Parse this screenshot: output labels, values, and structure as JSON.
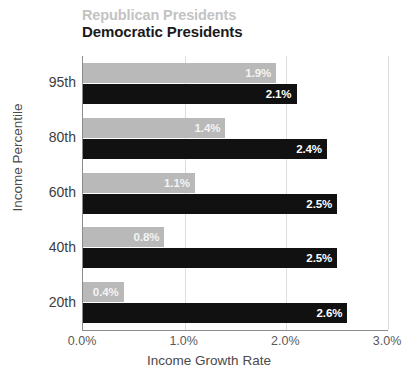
{
  "legend": {
    "republican": "Republican Presidents",
    "democratic": "Democratic Presidents",
    "republican_color": "#b9b9b9",
    "democratic_color": "#111111"
  },
  "axes": {
    "ylabel": "Income Percentile",
    "xlabel": "Income Growth Rate",
    "xticks": [
      "0.0%",
      "1.0%",
      "2.0%",
      "3.0%"
    ],
    "yticks": [
      "95th",
      "80th",
      "60th",
      "40th",
      "20th"
    ]
  },
  "chart_data": {
    "type": "bar",
    "orientation": "horizontal",
    "title": "",
    "subtitle": "",
    "xlabel": "Income Growth Rate",
    "ylabel": "Income Percentile",
    "xlim": [
      0,
      3
    ],
    "ylim": null,
    "grid": true,
    "legend_position": "top-left",
    "categories": [
      "95th",
      "80th",
      "60th",
      "40th",
      "20th"
    ],
    "series": [
      {
        "name": "Republican Presidents",
        "color": "#b9b9b9",
        "values": [
          1.9,
          1.4,
          1.1,
          0.8,
          0.4
        ],
        "labels": [
          "1.9%",
          "1.4%",
          "1.1%",
          "0.8%",
          "0.4%"
        ]
      },
      {
        "name": "Democratic Presidents",
        "color": "#111111",
        "values": [
          2.1,
          2.4,
          2.5,
          2.5,
          2.6
        ],
        "labels": [
          "2.1%",
          "2.4%",
          "2.5%",
          "2.5%",
          "2.6%"
        ]
      }
    ],
    "xtick_values": [
      0,
      1,
      2,
      3
    ],
    "xtick_labels": [
      "0.0%",
      "1.0%",
      "2.0%",
      "3.0%"
    ],
    "value_unit": "percent"
  }
}
